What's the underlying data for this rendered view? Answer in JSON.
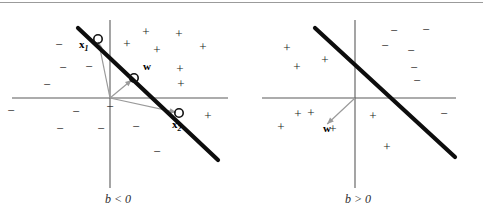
{
  "figure": {
    "background_color": "#ffffff",
    "top_rule_color": "#9b9b9b",
    "axis_color": "#5a5a5a",
    "boundary_color": "#0d0d0d",
    "arrow_color": "#9a9a9a",
    "marker_color": "#111111",
    "plus_glyph": "+",
    "minus_glyph": "−"
  },
  "panels": [
    {
      "id": "left",
      "caption": "b < 0",
      "origin": {
        "x": 110,
        "y": 98
      },
      "x_axis": {
        "x1": 12,
        "y1": 98,
        "x2": 228,
        "y2": 98
      },
      "y_axis": {
        "x1": 110,
        "y1": 20,
        "x2": 110,
        "y2": 188
      },
      "boundary": {
        "x1": 78,
        "y1": 28,
        "x2": 218,
        "y2": 160
      },
      "vectors": [
        {
          "label": "x",
          "subscript": "1",
          "label_x": 79,
          "label_y": 48,
          "tip": {
            "x": 98,
            "y": 39
          },
          "marker": true
        },
        {
          "label": "w",
          "subscript": "",
          "label_x": 143,
          "label_y": 70,
          "tip": {
            "x": 134,
            "y": 78
          },
          "marker": true
        },
        {
          "label": "x",
          "subscript": "2",
          "label_x": 172,
          "label_y": 128,
          "tip": {
            "x": 179,
            "y": 113
          },
          "marker": true
        }
      ],
      "plus_points": [
        {
          "x": 127,
          "y": 45
        },
        {
          "x": 146,
          "y": 33
        },
        {
          "x": 157,
          "y": 51
        },
        {
          "x": 179,
          "y": 35
        },
        {
          "x": 180,
          "y": 70
        },
        {
          "x": 181,
          "y": 85
        },
        {
          "x": 203,
          "y": 48
        },
        {
          "x": 208,
          "y": 117
        }
      ],
      "minus_points": [
        {
          "x": 59,
          "y": 46
        },
        {
          "x": 63,
          "y": 69
        },
        {
          "x": 47,
          "y": 86
        },
        {
          "x": 89,
          "y": 68
        },
        {
          "x": 76,
          "y": 113
        },
        {
          "x": 110,
          "y": 108
        },
        {
          "x": 60,
          "y": 130
        },
        {
          "x": 101,
          "y": 130
        },
        {
          "x": 136,
          "y": 128
        },
        {
          "x": 157,
          "y": 153
        },
        {
          "x": 11,
          "y": 112
        }
      ]
    },
    {
      "id": "right",
      "caption": "b > 0",
      "origin": {
        "x": 355,
        "y": 98
      },
      "x_axis": {
        "x1": 262,
        "y1": 98,
        "x2": 456,
        "y2": 98
      },
      "y_axis": {
        "x1": 355,
        "y1": 20,
        "x2": 355,
        "y2": 188
      },
      "boundary": {
        "x1": 315,
        "y1": 28,
        "x2": 455,
        "y2": 157
      },
      "vectors": [
        {
          "label": "w",
          "subscript": "",
          "label_x": 323,
          "label_y": 132,
          "tip": {
            "x": 325,
            "y": 126
          },
          "marker": false
        }
      ],
      "plus_points": [
        {
          "x": 287,
          "y": 49
        },
        {
          "x": 297,
          "y": 68
        },
        {
          "x": 325,
          "y": 61
        },
        {
          "x": 311,
          "y": 114
        },
        {
          "x": 298,
          "y": 115
        },
        {
          "x": 281,
          "y": 128
        },
        {
          "x": 333,
          "y": 130
        },
        {
          "x": 373,
          "y": 117
        },
        {
          "x": 387,
          "y": 148
        }
      ],
      "minus_points": [
        {
          "x": 385,
          "y": 47
        },
        {
          "x": 394,
          "y": 32
        },
        {
          "x": 411,
          "y": 52
        },
        {
          "x": 426,
          "y": 31
        },
        {
          "x": 414,
          "y": 69
        },
        {
          "x": 417,
          "y": 82
        },
        {
          "x": 444,
          "y": 115
        }
      ]
    }
  ]
}
